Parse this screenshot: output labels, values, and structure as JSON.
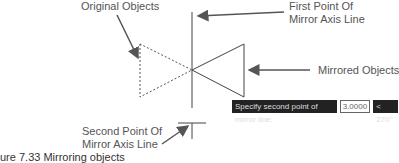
{
  "labels": {
    "original": "Original Objects",
    "first_point_line1": "First Point Of",
    "first_point_line2": "Mirror Axis Line",
    "mirrored": "Mirrored Objects",
    "second_point_line1": "Second Point Of",
    "second_point_line2": "Mirror Axis Line"
  },
  "command_line": {
    "prompt": "Specify second point of mirror line:",
    "value": "3.0000",
    "angle": "< 270°"
  },
  "caption": "ure 7.33    Mirroring objects",
  "colors": {
    "line": "#444444",
    "arrow": "#555555",
    "prompt_bg": "#222222"
  }
}
